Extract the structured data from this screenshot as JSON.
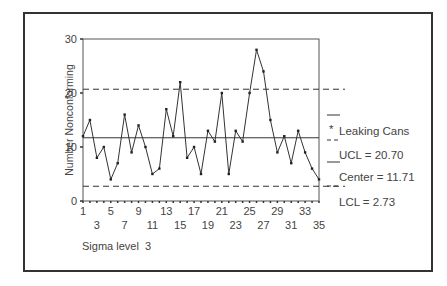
{
  "chart_data": {
    "type": "line",
    "subtype": "np control chart",
    "title": "",
    "xlabel": "",
    "ylabel": "Number Nonconforming",
    "ylim": [
      0,
      30
    ],
    "xlim": [
      1,
      35
    ],
    "yticks": [
      0,
      10,
      20,
      30
    ],
    "xticks_row1": [
      1,
      5,
      9,
      13,
      17,
      21,
      25,
      29,
      33
    ],
    "xticks_row2": [
      3,
      7,
      11,
      15,
      19,
      23,
      27,
      31,
      35
    ],
    "grid": false,
    "legend_position": "right",
    "series": [
      {
        "name": "Leaking Cans",
        "x": [
          1,
          2,
          3,
          4,
          5,
          6,
          7,
          8,
          9,
          10,
          11,
          12,
          13,
          14,
          15,
          16,
          17,
          18,
          19,
          20,
          21,
          22,
          23,
          24,
          25,
          26,
          27,
          28,
          29,
          30,
          31,
          32,
          33,
          34,
          35
        ],
        "values": [
          12,
          15,
          8,
          10,
          4,
          7,
          16,
          9,
          14,
          10,
          5,
          6,
          17,
          12,
          22,
          8,
          10,
          5,
          13,
          11,
          20,
          5,
          13,
          11,
          20,
          28,
          24,
          15,
          9,
          12,
          7,
          13,
          9,
          6,
          4
        ]
      }
    ],
    "control_limits": {
      "UCL": 20.7,
      "Center": 11.71,
      "LCL": 2.73
    },
    "annotations": [
      "Sigma level 3"
    ]
  },
  "legend": {
    "series_label": "Leaking Cans",
    "series_marker": "*",
    "ucl_label": "UCL = 20.70",
    "center_label": "Center = 11.71",
    "lcl_label": "LCL = 2.73"
  },
  "axis": {
    "y_title": "Number Nonconforming",
    "y_ticks": [
      "0",
      "10",
      "20",
      "30"
    ],
    "x_ticks_row1": [
      "1",
      "5",
      "9",
      "13",
      "17",
      "21",
      "25",
      "29",
      "33"
    ],
    "x_ticks_row2": [
      "3",
      "7",
      "11",
      "15",
      "19",
      "23",
      "27",
      "31",
      "35"
    ]
  },
  "footer": {
    "sigma_label": "Sigma level  3"
  },
  "colors": {
    "line": "#333333",
    "frame": "#333333",
    "text": "#444444"
  }
}
